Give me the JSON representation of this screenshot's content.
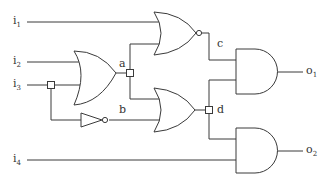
{
  "inputs": [
    {
      "id": "i1",
      "base": "i",
      "sub": "1"
    },
    {
      "id": "i2",
      "base": "i",
      "sub": "2"
    },
    {
      "id": "i3",
      "base": "i",
      "sub": "3"
    },
    {
      "id": "i4",
      "base": "i",
      "sub": "4"
    }
  ],
  "outputs": [
    {
      "id": "o1",
      "base": "o",
      "sub": "1"
    },
    {
      "id": "o2",
      "base": "o",
      "sub": "2"
    }
  ],
  "nodes": {
    "a": "a",
    "b": "b",
    "c": "c",
    "d": "d"
  },
  "gates": [
    {
      "name": "or-gate-1",
      "type": "OR",
      "inputs": [
        "i2",
        "i3"
      ],
      "output": "a"
    },
    {
      "name": "not-gate",
      "type": "NOT",
      "inputs": [
        "i3"
      ],
      "output": "b"
    },
    {
      "name": "nor-gate",
      "type": "NOR",
      "inputs": [
        "i1",
        "a"
      ],
      "output": "c"
    },
    {
      "name": "or-gate-2",
      "type": "OR",
      "inputs": [
        "a",
        "b"
      ],
      "output": "d"
    },
    {
      "name": "and-gate-1",
      "type": "AND",
      "inputs": [
        "c",
        "d"
      ],
      "output": "o1"
    },
    {
      "name": "and-gate-2",
      "type": "AND",
      "inputs": [
        "d",
        "i4"
      ],
      "output": "o2"
    }
  ]
}
